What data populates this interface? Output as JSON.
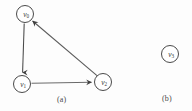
{
  "figure": {
    "background_color": "#fdfdfd",
    "stroke_color": "#4a4a4a",
    "panels": [
      {
        "id": "a",
        "caption": "(a)",
        "nodes": [
          {
            "id": "v0",
            "label_base": "v",
            "label_sub": "0",
            "x": 25,
            "y": 14,
            "r": 9
          },
          {
            "id": "v1",
            "label_base": "v",
            "label_sub": "1",
            "x": 22,
            "y": 84,
            "r": 9
          },
          {
            "id": "v2",
            "label_base": "v",
            "label_sub": "2",
            "x": 103,
            "y": 82,
            "r": 9
          }
        ],
        "edges": [
          {
            "from": "v0",
            "to": "v1",
            "directed": true,
            "shape": "vertical"
          },
          {
            "from": "v1",
            "to": "v2",
            "directed": true,
            "shape": "horizontal"
          },
          {
            "from": "v2",
            "to": "v0",
            "directed": true,
            "shape": "diagonal"
          }
        ]
      },
      {
        "id": "b",
        "caption": "(b)",
        "nodes": [
          {
            "id": "v3",
            "label_base": "v",
            "label_sub": "3",
            "x": 35,
            "y": 54,
            "r": 9
          }
        ],
        "edges": []
      }
    ]
  }
}
